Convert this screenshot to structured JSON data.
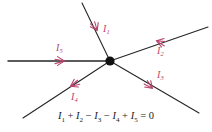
{
  "figure": {
    "type": "circuit-junction-diagram",
    "background_color": "#ffffff",
    "wire_color": "#262626",
    "node_color": "#111111",
    "arrow_color": "#b8446b",
    "equation_color": "#1a1a1a"
  },
  "junction": {
    "label": "node",
    "x": 110,
    "y": 61
  },
  "branches": [
    {
      "id": "branch-1",
      "label": "I",
      "subscript": "1",
      "label_x": 103,
      "label_y": 24,
      "direction": "into-node",
      "arrow_heading": "down-right",
      "end_x": 82,
      "end_y": 3,
      "arrow_x": 97,
      "arrow_y": 30,
      "arrow_angle": 63
    },
    {
      "id": "branch-2",
      "label": "I",
      "subscript": "2",
      "label_x": 157,
      "label_y": 46,
      "direction": "into-node",
      "arrow_heading": "down-left",
      "end_x": 208,
      "end_y": 27,
      "arrow_x": 157,
      "arrow_y": 41,
      "arrow_angle": 197
    },
    {
      "id": "branch-3",
      "label": "I",
      "subscript": "3",
      "label_x": 157,
      "label_y": 70,
      "direction": "out-of-node",
      "arrow_heading": "down-right",
      "end_x": 199,
      "end_y": 113,
      "arrow_x": 152,
      "arrow_y": 88,
      "arrow_angle": 44
    },
    {
      "id": "branch-4",
      "label": "I",
      "subscript": "4",
      "label_x": 71,
      "label_y": 92,
      "direction": "out-of-node",
      "arrow_heading": "down-left",
      "end_x": 23,
      "end_y": 118,
      "arrow_x": 71,
      "arrow_y": 86,
      "arrow_angle": 152
    },
    {
      "id": "branch-5",
      "label": "I",
      "subscript": "5",
      "label_x": 56,
      "label_y": 43,
      "direction": "into-node",
      "arrow_heading": "right",
      "end_x": 8,
      "end_y": 61,
      "arrow_x": 64,
      "arrow_y": 61,
      "arrow_angle": 0
    }
  ],
  "equation": {
    "text": "I₁ + I₂ − I₃ − I₄ + I₅ = 0",
    "plain": "I1 + I2 - I3 - I4 + I5 = 0",
    "terms": [
      {
        "sign": "",
        "label": "I",
        "subscript": "1"
      },
      {
        "sign": "+",
        "label": "I",
        "subscript": "2"
      },
      {
        "sign": "−",
        "label": "I",
        "subscript": "3"
      },
      {
        "sign": "−",
        "label": "I",
        "subscript": "4"
      },
      {
        "sign": "+",
        "label": "I",
        "subscript": "5"
      }
    ],
    "right_hand_side": "= 0"
  }
}
